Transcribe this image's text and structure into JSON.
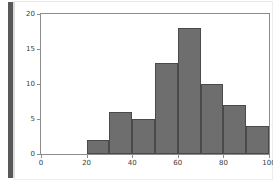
{
  "window": {
    "background_color": "#ffffff",
    "scrollbar_color": "#585858"
  },
  "chart_data": {
    "type": "bar",
    "title": "",
    "xlabel": "",
    "ylabel": "",
    "categories": [
      "20-30",
      "30-40",
      "40-50",
      "50-60",
      "60-70",
      "70-80",
      "80-90",
      "90-100"
    ],
    "bin_edges": [
      20,
      30,
      40,
      50,
      60,
      70,
      80,
      90,
      100
    ],
    "values": [
      2,
      6,
      5,
      13,
      18,
      10,
      7,
      4
    ],
    "xlim": [
      0,
      100
    ],
    "ylim": [
      0,
      20
    ],
    "xticks": [
      0,
      20,
      40,
      60,
      80,
      100
    ],
    "xtick_labels": [
      "0",
      "20",
      "40",
      "60",
      "80",
      "100"
    ],
    "yticks": [
      0,
      5,
      10,
      15,
      20
    ],
    "ytick_labels": [
      "0",
      "5",
      "10",
      "15",
      "20"
    ],
    "grid": false,
    "legend": null,
    "bar_fill_color": "#6e6e6e",
    "bar_edge_color": "#4a4a4a",
    "axis_color": "#8c8c8c",
    "plot_background": "#ffffff"
  }
}
